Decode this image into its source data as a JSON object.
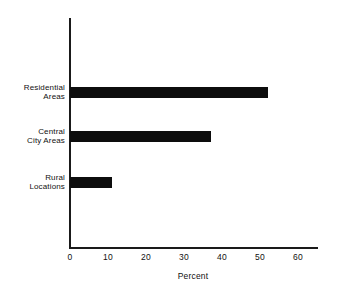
{
  "chart_data": {
    "type": "bar",
    "orientation": "horizontal",
    "title": "",
    "subtitle": "",
    "xlabel": "Percent",
    "ylabel": "",
    "categories": [
      "Residential Areas",
      "Central City Areas",
      "Rural Locations"
    ],
    "category_lines": [
      [
        "Residential",
        "Areas"
      ],
      [
        "Central",
        "City Areas"
      ],
      [
        "Rural",
        "Locations"
      ]
    ],
    "values": [
      52,
      37,
      11
    ],
    "xlim": [
      0,
      60
    ],
    "xticks": [
      0,
      10,
      20,
      30,
      40,
      50,
      60
    ],
    "xtick_labels": [
      "0",
      "10",
      "20",
      "30",
      "40",
      "50",
      "60"
    ],
    "grid": false,
    "legend": false,
    "bar_color": "#0d0d0d",
    "axis_color": "#1a1a1a",
    "background_color": "#ffffff"
  },
  "axis": {
    "x_title": "Percent"
  }
}
